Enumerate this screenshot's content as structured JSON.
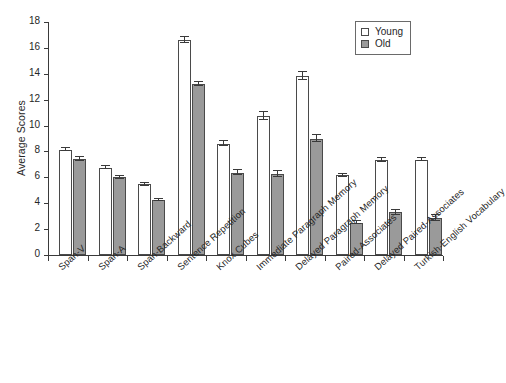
{
  "chart_data": {
    "type": "bar",
    "title": "",
    "xlabel": "",
    "ylabel": "Average Scores",
    "ylim": [
      0,
      18
    ],
    "ytick_values": [
      0,
      2,
      4,
      6,
      8,
      10,
      12,
      14,
      16,
      18
    ],
    "ytick_labels": [
      "0",
      "2",
      "4",
      "6",
      "8",
      "10",
      "12",
      "14",
      "16",
      "18"
    ],
    "grid": false,
    "legend_position": "top-right",
    "categories": [
      "Span-V",
      "Span-A",
      "Span-Backward",
      "Sentence Repetition",
      "Knox Cubes",
      "Immediate Paragraph Memory",
      "Delayed Paragraph Memory",
      "Paired-Associates",
      "Delayed Paired-Associates",
      "Turkish-English Vocabulary"
    ],
    "series": [
      {
        "name": "Young",
        "color": "#ffffff",
        "values": [
          8.15,
          6.75,
          5.45,
          16.6,
          8.6,
          10.75,
          13.85,
          6.15,
          7.35,
          7.35
        ],
        "errors": [
          0.12,
          0.1,
          0.1,
          0.25,
          0.18,
          0.3,
          0.3,
          0.12,
          0.15,
          0.12
        ]
      },
      {
        "name": "Old",
        "color": "#9a9a9a",
        "values": [
          7.4,
          6.0,
          4.25,
          13.2,
          6.35,
          6.25,
          9.0,
          2.5,
          3.3,
          2.85
        ],
        "errors": [
          0.15,
          0.12,
          0.1,
          0.18,
          0.18,
          0.22,
          0.3,
          0.12,
          0.18,
          0.22
        ]
      }
    ]
  },
  "legend": {
    "items": [
      {
        "label": "Young",
        "swatch": "open-square-white"
      },
      {
        "label": "Old",
        "swatch": "filled-square-gray"
      }
    ]
  },
  "colors": {
    "young_fill": "#ffffff",
    "old_fill": "#9a9a9a",
    "axis": "#3a3a3a",
    "text": "#262626",
    "background": "#ffffff"
  }
}
